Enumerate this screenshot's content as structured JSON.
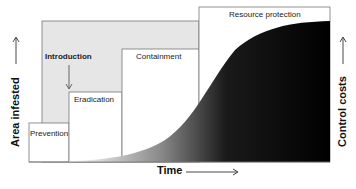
{
  "diagram": {
    "phases": [
      {
        "label": "Prevention"
      },
      {
        "label": "Eradication"
      },
      {
        "label": "Containment"
      },
      {
        "label": "Resource protection"
      }
    ],
    "event_label": "Introduction",
    "x_axis_label": "Time",
    "y_axis_left_label": "Area infested",
    "y_axis_right_label": "Control costs",
    "colors": {
      "background_gray": "#e6e6e6",
      "box_border": "#777777",
      "curve_fill_start": "#ffffff",
      "curve_fill_end": "#000000"
    }
  }
}
